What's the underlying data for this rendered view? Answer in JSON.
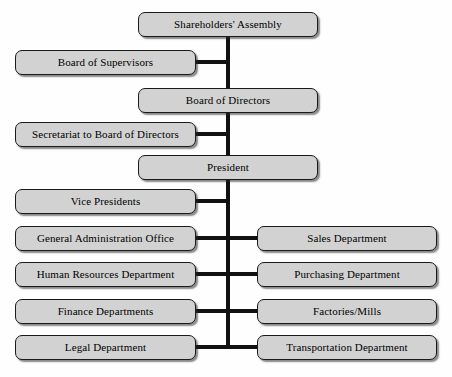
{
  "diagram": {
    "colors": {
      "node_fill": "#d2d2d2",
      "node_border": "#1a1a1a",
      "line": "#111111",
      "background": "#fefefe",
      "text": "#000000"
    },
    "trunk": {
      "x": 228,
      "top": 37,
      "bottom": 348,
      "width": 4
    },
    "nodes": [
      {
        "id": "shareholders-assembly",
        "label": "Shareholders' Assembly",
        "column": "center",
        "x": 138,
        "y": 12,
        "w": 180,
        "h": 25
      },
      {
        "id": "board-of-supervisors",
        "label": "Board of Supervisors",
        "column": "left",
        "x": 15,
        "y": 50,
        "w": 181,
        "h": 25
      },
      {
        "id": "board-of-directors",
        "label": "Board of Directors",
        "column": "center",
        "x": 138,
        "y": 88,
        "w": 180,
        "h": 25
      },
      {
        "id": "secretariat-to-board-of-directors",
        "label": "Secretariat to Board of Directors",
        "column": "left",
        "x": 15,
        "y": 122,
        "w": 181,
        "h": 25
      },
      {
        "id": "president",
        "label": "President",
        "column": "center",
        "x": 138,
        "y": 155,
        "w": 180,
        "h": 25
      },
      {
        "id": "vice-presidents",
        "label": "Vice Presidents",
        "column": "left",
        "x": 15,
        "y": 189,
        "w": 181,
        "h": 25
      },
      {
        "id": "general-administration-office",
        "label": "General Administration Office",
        "column": "left",
        "x": 15,
        "y": 226,
        "w": 181,
        "h": 25
      },
      {
        "id": "sales-department",
        "label": "Sales Department",
        "column": "right",
        "x": 257,
        "y": 226,
        "w": 180,
        "h": 25
      },
      {
        "id": "human-resources-department",
        "label": "Human Resources Department",
        "column": "left",
        "x": 15,
        "y": 262,
        "w": 181,
        "h": 25
      },
      {
        "id": "purchasing-department",
        "label": "Purchasing Department",
        "column": "right",
        "x": 257,
        "y": 262,
        "w": 180,
        "h": 25
      },
      {
        "id": "finance-departments",
        "label": "Finance Departments",
        "column": "left",
        "x": 15,
        "y": 299,
        "w": 181,
        "h": 25
      },
      {
        "id": "factories-mills",
        "label": "Factories/Mills",
        "column": "right",
        "x": 257,
        "y": 299,
        "w": 180,
        "h": 25
      },
      {
        "id": "legal-department",
        "label": "Legal Department",
        "column": "left",
        "x": 15,
        "y": 335,
        "w": 181,
        "h": 25
      },
      {
        "id": "transportation-department",
        "label": "Transportation Department",
        "column": "right",
        "x": 257,
        "y": 335,
        "w": 180,
        "h": 25
      }
    ],
    "connectors": [
      {
        "from": "board-of-supervisors",
        "side": "left",
        "y": 62,
        "x1": 196,
        "x2": 230
      },
      {
        "from": "secretariat-to-board-of-directors",
        "side": "left",
        "y": 134,
        "x1": 196,
        "x2": 230
      },
      {
        "from": "vice-presidents",
        "side": "left",
        "y": 201,
        "x1": 196,
        "x2": 230
      },
      {
        "from": "general-administration-office",
        "side": "left",
        "y": 238,
        "x1": 196,
        "x2": 230
      },
      {
        "from": "sales-department",
        "side": "right",
        "y": 238,
        "x1": 226,
        "x2": 257
      },
      {
        "from": "human-resources-department",
        "side": "left",
        "y": 274,
        "x1": 196,
        "x2": 230
      },
      {
        "from": "purchasing-department",
        "side": "right",
        "y": 274,
        "x1": 226,
        "x2": 257
      },
      {
        "from": "finance-departments",
        "side": "left",
        "y": 311,
        "x1": 196,
        "x2": 230
      },
      {
        "from": "factories-mills",
        "side": "right",
        "y": 311,
        "x1": 226,
        "x2": 257
      },
      {
        "from": "legal-department",
        "side": "left",
        "y": 347,
        "x1": 196,
        "x2": 230
      },
      {
        "from": "transportation-department",
        "side": "right",
        "y": 347,
        "x1": 226,
        "x2": 257
      }
    ]
  }
}
